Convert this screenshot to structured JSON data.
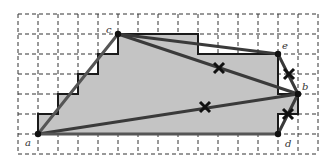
{
  "figure": {
    "type": "lattice-polygon-diagram",
    "grid": {
      "x0": 18,
      "y0": 14,
      "cols": 15,
      "rows": 7,
      "spacing": 20,
      "line_color": "#333333",
      "dash": "4,3"
    },
    "fill_color": "#c4c4c4",
    "outline_color": "#1a1a1a",
    "segment_color": "#3a3a3a",
    "points": [
      {
        "id": "a",
        "label": "a",
        "x": 38,
        "y": 134,
        "lx": 25,
        "ly": 146
      },
      {
        "id": "b",
        "label": "b",
        "x": 298,
        "y": 94,
        "lx": 302,
        "ly": 90
      },
      {
        "id": "c",
        "label": "c",
        "x": 118,
        "y": 34,
        "lx": 106,
        "ly": 33
      },
      {
        "id": "d",
        "label": "d",
        "x": 278,
        "y": 134,
        "lx": 285,
        "ly": 147
      },
      {
        "id": "e",
        "label": "e",
        "x": 278,
        "y": 54,
        "lx": 282,
        "ly": 49
      }
    ],
    "polygon": [
      [
        38,
        134
      ],
      [
        38,
        114
      ],
      [
        58,
        114
      ],
      [
        58,
        94
      ],
      [
        78,
        94
      ],
      [
        78,
        74
      ],
      [
        98,
        74
      ],
      [
        98,
        54
      ],
      [
        118,
        54
      ],
      [
        118,
        34
      ],
      [
        198,
        34
      ],
      [
        198,
        54
      ],
      [
        278,
        54
      ],
      [
        278,
        94
      ],
      [
        298,
        94
      ],
      [
        298,
        114
      ],
      [
        278,
        114
      ],
      [
        278,
        134
      ]
    ],
    "segments": [
      {
        "from": "a",
        "to": "c",
        "color": "#555555"
      },
      {
        "from": "c",
        "to": "e",
        "color": "#3a3a3a"
      },
      {
        "from": "c",
        "to": "b",
        "color": "#3a3a3a"
      },
      {
        "from": "e",
        "to": "b",
        "color": "#3a3a3a"
      },
      {
        "from": "b",
        "to": "d",
        "color": "#3a3a3a"
      },
      {
        "from": "a",
        "to": "b",
        "color": "#3a3a3a"
      },
      {
        "from": "a",
        "to": "d",
        "color": "#555555"
      }
    ],
    "cross_marks": [
      {
        "x": 219,
        "y": 68
      },
      {
        "x": 289,
        "y": 74
      },
      {
        "x": 205,
        "y": 107
      },
      {
        "x": 288,
        "y": 114
      }
    ]
  }
}
